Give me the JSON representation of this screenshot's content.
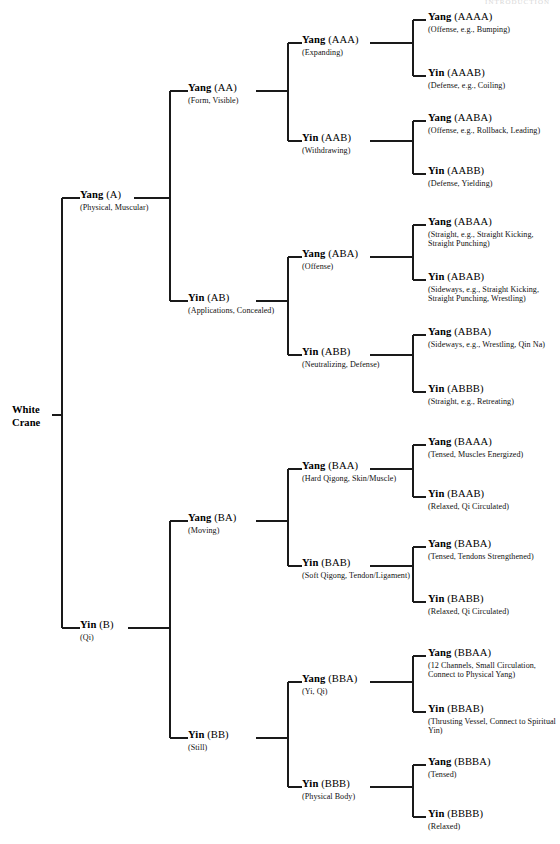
{
  "page": {
    "header_watermark": "INTRODUCTION",
    "background_color": "#ffffff",
    "line_color": "#1a1a1a"
  },
  "diagram": {
    "type": "binary-tree",
    "root": {
      "id": "root",
      "label": "White\nCrane"
    },
    "nodes": [
      {
        "id": "A",
        "polarity": "Yang",
        "code": "(A)",
        "desc": "(Physical,\nMuscular)"
      },
      {
        "id": "B",
        "polarity": "Yin",
        "code": "(B)",
        "desc": "(Qi)"
      },
      {
        "id": "AA",
        "polarity": "Yang",
        "code": "(AA)",
        "desc": "(Form, Visible)"
      },
      {
        "id": "AB",
        "polarity": "Yin",
        "code": "(AB)",
        "desc": "(Applications,\nConcealed)"
      },
      {
        "id": "BA",
        "polarity": "Yang",
        "code": "(BA)",
        "desc": "(Moving)"
      },
      {
        "id": "BB",
        "polarity": "Yin",
        "code": "(BB)",
        "desc": "(Still)"
      },
      {
        "id": "AAA",
        "polarity": "Yang",
        "code": "(AAA)",
        "desc": "(Expanding)"
      },
      {
        "id": "AAB",
        "polarity": "Yin",
        "code": "(AAB)",
        "desc": "(Withdrawing)"
      },
      {
        "id": "ABA",
        "polarity": "Yang",
        "code": "(ABA)",
        "desc": "(Offense)"
      },
      {
        "id": "ABB",
        "polarity": "Yin",
        "code": "(ABB)",
        "desc": "(Neutralizing,\nDefense)"
      },
      {
        "id": "BAA",
        "polarity": "Yang",
        "code": "(BAA)",
        "desc": "(Hard Qigong,\nSkin/Muscle)"
      },
      {
        "id": "BAB",
        "polarity": "Yin",
        "code": "(BAB)",
        "desc": "(Soft Qigong,\nTendon/Ligament)"
      },
      {
        "id": "BBA",
        "polarity": "Yang",
        "code": "(BBA)",
        "desc": "(Yi, Qi)"
      },
      {
        "id": "BBB",
        "polarity": "Yin",
        "code": "(BBB)",
        "desc": "(Physical Body)"
      },
      {
        "id": "AAAA",
        "polarity": "Yang",
        "code": "(AAAA)",
        "desc": "(Offense, e.g., Bumping)"
      },
      {
        "id": "AAAB",
        "polarity": "Yin",
        "code": "(AAAB)",
        "desc": "(Defense, e.g., Coiling)"
      },
      {
        "id": "AABA",
        "polarity": "Yang",
        "code": "(AABA)",
        "desc": "(Offense,  e.g.,  Rollback,\nLeading)"
      },
      {
        "id": "AABB",
        "polarity": "Yin",
        "code": "(AABB)",
        "desc": "(Defense, Yielding)"
      },
      {
        "id": "ABAA",
        "polarity": "Yang",
        "code": "(ABAA)",
        "desc": "(Straight, e.g., Straight\nKicking, Straight Punching)"
      },
      {
        "id": "ABAB",
        "polarity": "Yin",
        "code": "(ABAB)",
        "desc": "(Sideways, e.g., Straight Kicking,\nStraight Punching, Wrestling)"
      },
      {
        "id": "ABBA",
        "polarity": "Yang",
        "code": "(ABBA)",
        "desc": "(Sideways, e.g., Wrestling,\nQin Na)"
      },
      {
        "id": "ABBB",
        "polarity": "Yin",
        "code": "(ABBB)",
        "desc": "(Straight, e.g., Retreating)"
      },
      {
        "id": "BAAA",
        "polarity": "Yang",
        "code": "(BAAA)",
        "desc": "(Tensed, Muscles Energized)"
      },
      {
        "id": "BAAB",
        "polarity": "Yin",
        "code": "(BAAB)",
        "desc": "(Relaxed, Qi Circulated)"
      },
      {
        "id": "BABA",
        "polarity": "Yang",
        "code": "(BABA)",
        "desc": "(Tensed, Tendons\nStrengthened)"
      },
      {
        "id": "BABB",
        "polarity": "Yin",
        "code": "(BABB)",
        "desc": "(Relaxed, Qi Circulated)"
      },
      {
        "id": "BBAA",
        "polarity": "Yang",
        "code": "(BBAA)",
        "desc": "(12 Channels, Small\nCirculation, Connect to\nPhysical Yang)"
      },
      {
        "id": "BBAB",
        "polarity": "Yin",
        "code": "(BBAB)",
        "desc": "(Thrusting Vessel,\nConnect to Spiritual Yin)"
      },
      {
        "id": "BBBA",
        "polarity": "Yang",
        "code": "(BBBA)",
        "desc": "(Tensed)"
      },
      {
        "id": "BBBB",
        "polarity": "Yin",
        "code": "(BBBB)",
        "desc": "(Relaxed)"
      }
    ]
  }
}
